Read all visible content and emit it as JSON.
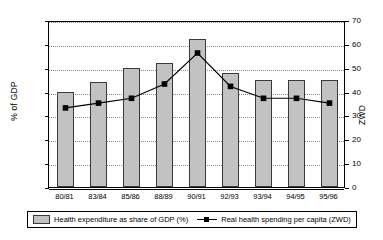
{
  "chart_data": {
    "type": "bar",
    "title": "",
    "categories": [
      "80/81",
      "83/84",
      "85/86",
      "88/89",
      "90/91",
      "92/93",
      "93/94",
      "94/95",
      "95/96"
    ],
    "series": [
      {
        "name": "Health expenditure as share of GDP (%)",
        "type": "bar",
        "axis": "left",
        "values": [
          2.0,
          2.2,
          2.5,
          2.6,
          3.1,
          2.4,
          2.25,
          2.25,
          2.25
        ],
        "color": "#c2c2c2"
      },
      {
        "name": "Real health spending per capita (ZWD)",
        "type": "line",
        "axis": "right",
        "values": [
          34,
          36,
          38,
          44,
          57,
          43,
          38,
          38,
          36
        ],
        "color": "#000000"
      }
    ],
    "xlabel": "",
    "ylabel": "% of GDP",
    "ylabel_right": "ZWD",
    "ylim": [
      0,
      3.5
    ],
    "ylim_right": [
      0,
      70
    ],
    "yticks": [
      "0",
      "0.5",
      "1",
      "1.5",
      "2",
      "2.5",
      "3",
      "3.5"
    ],
    "yticks_right": [
      "0",
      "10",
      "20",
      "30",
      "40",
      "50",
      "60",
      "70"
    ],
    "grid": true,
    "legend_position": "bottom"
  },
  "legend": {
    "items": [
      {
        "label": "Health expenditure as share of GDP (%)",
        "marker": "bar-swatch"
      },
      {
        "label": "Real health spending per capita (ZWD)",
        "marker": "line-marker-swatch"
      }
    ]
  }
}
